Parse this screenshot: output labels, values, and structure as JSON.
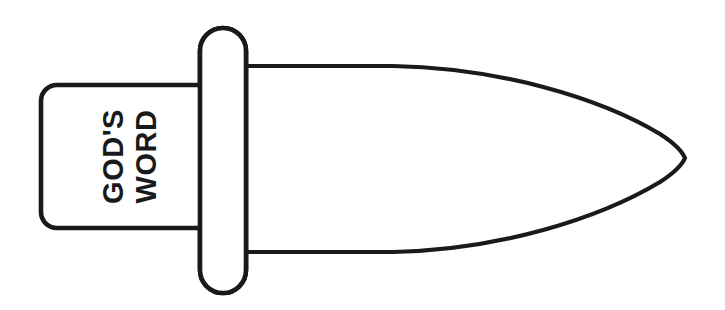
{
  "illustration": {
    "title": "God's Word Sword",
    "type": "line-art-diagram",
    "background_color": "#ffffff",
    "stroke_color": "#1a1a1a",
    "fill_color": "#ffffff",
    "stroke_width": 4.6
  },
  "handle": {
    "name": "sword-handle",
    "label_line_1": "GOD'S",
    "label_line_2": "WORD",
    "text_rotation_degrees": -90,
    "x": 41,
    "y": 85,
    "width": 159,
    "height": 143,
    "corner_radius": 16
  },
  "guard": {
    "name": "sword-guard",
    "x": 200,
    "y": 28,
    "width": 46,
    "height": 265,
    "corner_radius": 23
  },
  "blade": {
    "name": "sword-blade",
    "base_x": 246,
    "top_y": 66,
    "bottom_y": 252,
    "tip_x": 685,
    "tip_y": 158,
    "shape": "ogival-leaf-point"
  },
  "canvas": {
    "width": 725,
    "height": 310
  }
}
